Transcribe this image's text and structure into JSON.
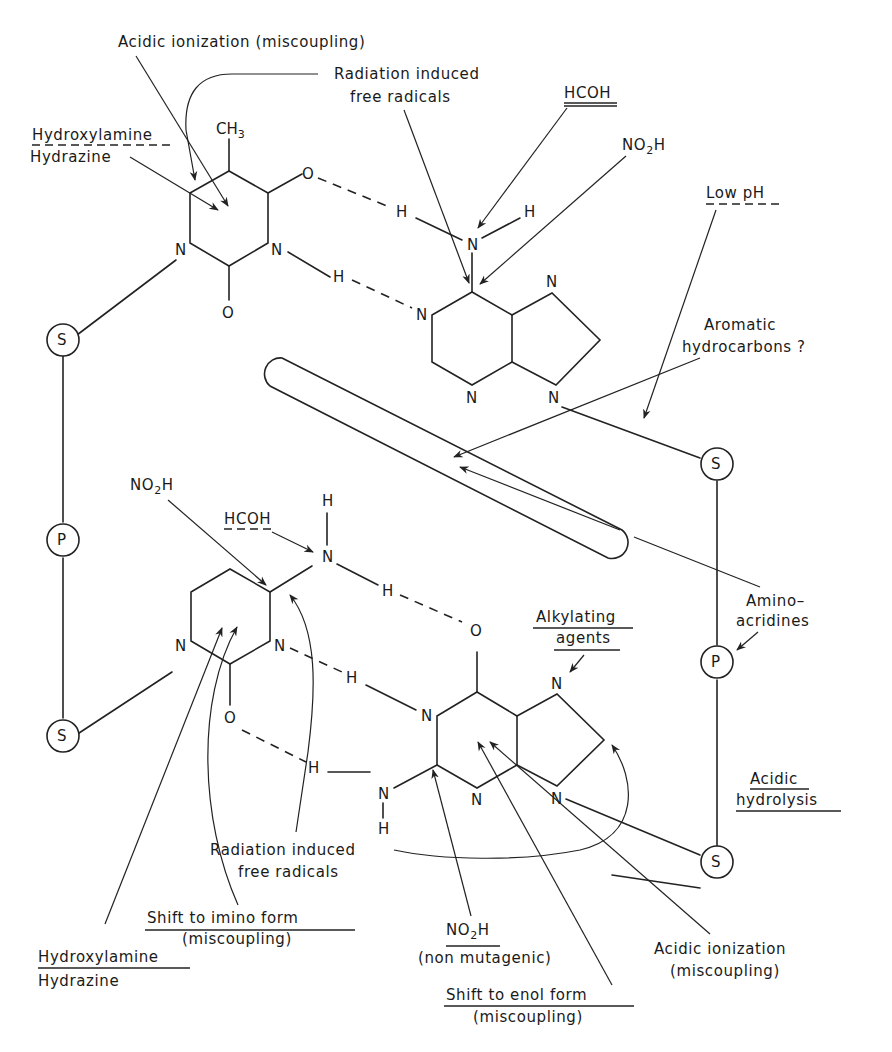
{
  "diagram": {
    "top_pair": {
      "pyrimidine": "thymine",
      "purine": "adenine",
      "atoms": {
        "methyl": "CH",
        "methyl_sub": "3",
        "o_upper": "O",
        "o_lower": "O",
        "n1": "N",
        "n3": "N",
        "h_bond_1": "H",
        "h_bond_2": "H",
        "amino_n": "N",
        "amino_h": "H",
        "pur_n1": "N",
        "pur_n3": "N",
        "pur_n7": "N",
        "pur_n9": "N"
      }
    },
    "bottom_pair": {
      "pyrimidine": "cytosine",
      "purine": "guanine",
      "atoms": {
        "amino_h_top": "H",
        "amino_n": "N",
        "h_bond_1": "H",
        "o_guanine": "O",
        "n1": "N",
        "n3": "N",
        "h_bond_2": "H",
        "o_cytosine": "O",
        "h_bond_3": "H",
        "pur_n1": "N",
        "pur_n3": "N",
        "pur_n7": "N",
        "pur_n9": "N",
        "g_amino_n": "N",
        "g_amino_h": "H"
      }
    },
    "backbone": {
      "left": [
        "S",
        "P",
        "S"
      ],
      "right": [
        "S",
        "P",
        "S"
      ]
    },
    "labels": {
      "acidic_ionization_top": "Acidic ionization (miscoupling)",
      "radiation_top_line1": "Radiation induced",
      "radiation_top_line2": "free radicals",
      "hcoh_top": "HCOH",
      "no2h_top": "NO",
      "no2h_top_sub": "2",
      "no2h_top_tail": "H",
      "hydroxylamine_top": "Hydroxylamine",
      "hydrazine_top": "Hydrazine",
      "low_ph": "Low pH",
      "aromatic_line1": "Aromatic",
      "aromatic_line2": "hydrocarbons ?",
      "no2h_mid": "NO",
      "no2h_mid_sub": "2",
      "no2h_mid_tail": "H",
      "hcoh_mid": "HCOH",
      "aminoacridines_line1": "Amino–",
      "aminoacridines_line2": "acridines",
      "alkylating_line1": "Alkylating",
      "alkylating_line2": "agents",
      "acidic_hydrolysis_line1": "Acidic",
      "acidic_hydrolysis_line2": "hydrolysis",
      "radiation_bottom_line1": "Radiation induced",
      "radiation_bottom_line2": "free radicals",
      "hydroxylamine_bottom": "Hydroxylamine",
      "hydrazine_bottom": "Hydrazine",
      "imino_line1": "Shift to imino form",
      "imino_line2": "(miscoupling)",
      "no2h_bottom": "NO",
      "no2h_bottom_sub": "2",
      "no2h_bottom_tail": "H",
      "non_mutagenic": "(non mutagenic)",
      "enol_line1": "Shift to enol form",
      "enol_line2": "(miscoupling)",
      "acidic_ionization_bottom_line1": "Acidic ionization",
      "acidic_ionization_bottom_line2": "(miscoupling)"
    }
  }
}
